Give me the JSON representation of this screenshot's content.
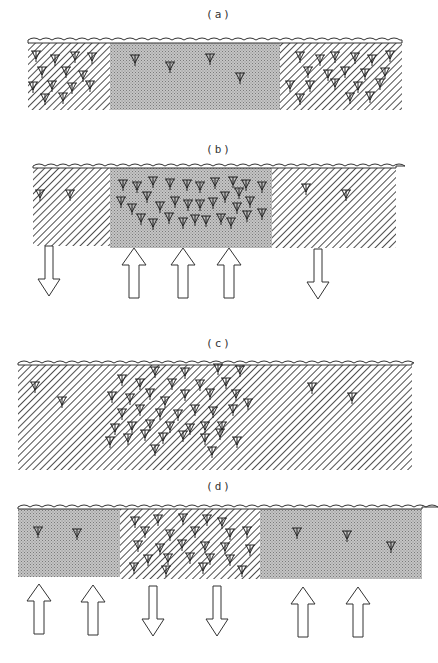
{
  "panels": [
    {
      "label": "(a)",
      "zones": [
        {
          "name": "left",
          "pattern": "hatched",
          "density": "high"
        },
        {
          "name": "middle",
          "pattern": "stippled",
          "density": "low"
        },
        {
          "name": "right",
          "pattern": "hatched",
          "density": "high"
        }
      ],
      "arrows": []
    },
    {
      "label": "(b)",
      "zones": [
        {
          "name": "left",
          "pattern": "hatched",
          "density": "low"
        },
        {
          "name": "middle",
          "pattern": "stippled",
          "density": "high"
        },
        {
          "name": "right",
          "pattern": "hatched",
          "density": "low"
        }
      ],
      "arrows": [
        "down",
        "up",
        "up",
        "up",
        "down"
      ]
    },
    {
      "label": "(c)",
      "zones": [
        {
          "name": "whole",
          "pattern": "hatched",
          "density": "clustered-center"
        }
      ],
      "arrows": []
    },
    {
      "label": "(d)",
      "zones": [
        {
          "name": "left",
          "pattern": "stippled",
          "density": "low"
        },
        {
          "name": "middle",
          "pattern": "hatched",
          "density": "high"
        },
        {
          "name": "right",
          "pattern": "stippled",
          "density": "low"
        }
      ],
      "arrows": [
        "up",
        "up",
        "down",
        "down",
        "up",
        "up"
      ]
    }
  ],
  "icons": {
    "plankton_symbol": "plankton-icon",
    "arrow_up": "arrow-up-icon",
    "arrow_down": "arrow-down-icon"
  },
  "colors": {
    "line": "#222222",
    "stipple_bg": "#bdbdbd",
    "paper": "#ffffff"
  }
}
